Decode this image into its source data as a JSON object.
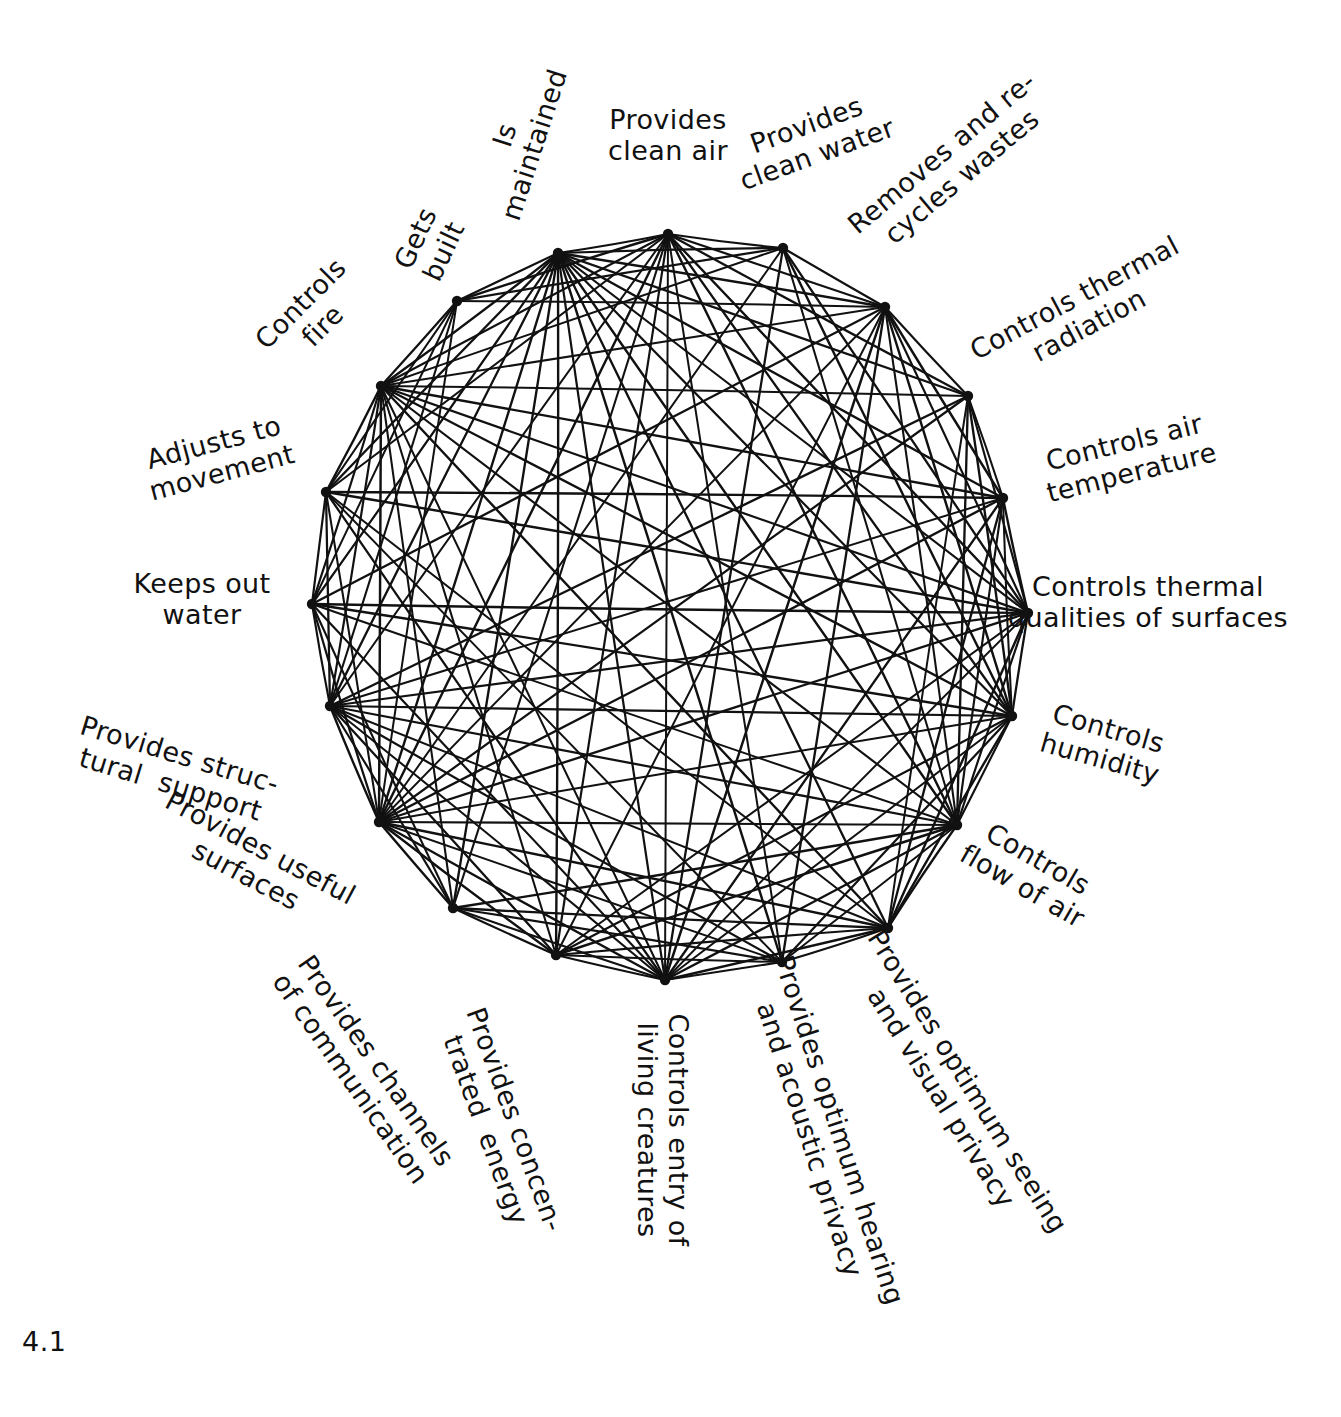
{
  "figure": {
    "number": "4.1",
    "type": "node-link circular interaction net diagram",
    "node_count": 19,
    "background_color": "#ffffff",
    "ink_color": "#111111"
  },
  "nodes": [
    {
      "id": 0,
      "label": "Provides\nclean air",
      "label_line1": "Provides",
      "label_line2": "clean air",
      "x": 668,
      "y": 234,
      "label_x": 668,
      "label_y": 136,
      "rotation": 0
    },
    {
      "id": 1,
      "label": "Provides\nclean water",
      "label_line1": "Provides",
      "label_line2": "clean water",
      "x": 783,
      "y": 248,
      "label_x": 812,
      "label_y": 140,
      "rotation": 20
    },
    {
      "id": 2,
      "label": "Removes and re-\ncycles wastes",
      "label_line1": "Removes and re-",
      "label_line2": "cycles wastes",
      "x": 885,
      "y": 307,
      "label_x": 952,
      "label_y": 165,
      "rotation": 40
    },
    {
      "id": 3,
      "label": "Controls thermal\nradiation",
      "label_line1": "Controls thermal",
      "label_line2": "radiation",
      "x": 968,
      "y": 396,
      "label_x": 1082,
      "label_y": 312,
      "rotation": 28
    },
    {
      "id": 4,
      "label": "Controls air\ntemperature",
      "label_line1": "Controls air",
      "label_line2": "temperature",
      "x": 1003,
      "y": 498,
      "label_x": 1128,
      "label_y": 458,
      "rotation": 14
    },
    {
      "id": 5,
      "label": "Controls thermal\nqualities of surfaces",
      "label_line1": "Controls thermal",
      "label_line2": "qualities of surfaces",
      "x": 1028,
      "y": 613,
      "label_x": 1148,
      "label_y": 603,
      "rotation": 0
    },
    {
      "id": 6,
      "label": "Controls\nhumidity",
      "label_line1": "Controls",
      "label_line2": "humidity",
      "x": 1012,
      "y": 716,
      "label_x": 1104,
      "label_y": 744,
      "rotation": -16
    },
    {
      "id": 7,
      "label": "Controls\nflow of air",
      "label_line1": "Controls",
      "label_line2": "flow of air",
      "x": 957,
      "y": 825,
      "label_x": 1030,
      "label_y": 873,
      "rotation": -30
    },
    {
      "id": 8,
      "label": "Provides optimum seeing\nand visual privacy",
      "label_line1": "Provides optimum seeing",
      "label_line2": "and visual privacy",
      "x": 888,
      "y": 928,
      "label_x": 954,
      "label_y": 1090,
      "rotation": -58
    },
    {
      "id": 9,
      "label": "Provides optimum hearing\nand acoustic privacy",
      "label_line1": "Provides optimum hearing",
      "label_line2": "and acoustic privacy",
      "x": 782,
      "y": 962,
      "label_x": 824,
      "label_y": 1135,
      "rotation": -72
    },
    {
      "id": 10,
      "label": "Controls entry of\nliving creatures",
      "label_line1": "Controls entry of",
      "label_line2": "living creatures",
      "x": 665,
      "y": 980,
      "label_x": 662,
      "label_y": 1130,
      "rotation": -90
    },
    {
      "id": 11,
      "label": "Provides concen-\ntrated  energy",
      "label_line1": "Provides concen-",
      "label_line2": "trated  energy",
      "x": 556,
      "y": 955,
      "label_x": 500,
      "label_y": 1125,
      "rotation": -70
    },
    {
      "id": 12,
      "label": "Provides channels\nof communication",
      "label_line1": "Provides channels",
      "label_line2": "of communication",
      "x": 453,
      "y": 908,
      "label_x": 363,
      "label_y": 1070,
      "rotation": -55
    },
    {
      "id": 13,
      "label": "Provides useful\nsurfaces",
      "label_line1": "Provides useful",
      "label_line2": "surfaces",
      "x": 379,
      "y": 822,
      "label_x": 253,
      "label_y": 862,
      "rotation": -28
    },
    {
      "id": 14,
      "label": "Provides struc-\ntural  support",
      "label_line1": "Provides struc-",
      "label_line2": "tural  support",
      "x": 330,
      "y": 706,
      "label_x": 175,
      "label_y": 770,
      "rotation": -17
    },
    {
      "id": 15,
      "label": "Keeps out\nwater",
      "label_line1": "Keeps out",
      "label_line2": "water",
      "x": 312,
      "y": 604,
      "label_x": 202,
      "label_y": 600,
      "rotation": 0
    },
    {
      "id": 16,
      "label": "Adjusts to\nmovement",
      "label_line1": "Adjusts to",
      "label_line2": "movement",
      "x": 326,
      "y": 492,
      "label_x": 218,
      "label_y": 458,
      "rotation": 15
    },
    {
      "id": 17,
      "label": "Controls\nfire",
      "label_line1": "Controls",
      "label_line2": "fire",
      "x": 381,
      "y": 386,
      "label_x": 312,
      "label_y": 315,
      "rotation": 45
    },
    {
      "id": 18,
      "label": "Gets\nbuilt",
      "label_line1": "Gets",
      "label_line2": "built",
      "x": 457,
      "y": 301,
      "label_x": 430,
      "label_y": 245,
      "rotation": 65
    },
    {
      "id": 19,
      "label": "Is\nmaintained",
      "label_line1": "Is",
      "label_line2": "maintained",
      "x": 558,
      "y": 253,
      "label_x": 520,
      "label_y": 140,
      "rotation": 72
    }
  ],
  "edges": [
    [
      0,
      1
    ],
    [
      0,
      2
    ],
    [
      0,
      3
    ],
    [
      0,
      5
    ],
    [
      0,
      6
    ],
    [
      0,
      7
    ],
    [
      0,
      9
    ],
    [
      0,
      10
    ],
    [
      0,
      11
    ],
    [
      0,
      12
    ],
    [
      0,
      13
    ],
    [
      0,
      14
    ],
    [
      0,
      16
    ],
    [
      0,
      17
    ],
    [
      0,
      18
    ],
    [
      0,
      19
    ],
    [
      1,
      2
    ],
    [
      1,
      5
    ],
    [
      1,
      6
    ],
    [
      1,
      7
    ],
    [
      1,
      10
    ],
    [
      1,
      13
    ],
    [
      1,
      17
    ],
    [
      1,
      18
    ],
    [
      1,
      19
    ],
    [
      2,
      3
    ],
    [
      2,
      4
    ],
    [
      2,
      5
    ],
    [
      2,
      6
    ],
    [
      2,
      7
    ],
    [
      2,
      9
    ],
    [
      2,
      10
    ],
    [
      2,
      11
    ],
    [
      2,
      13
    ],
    [
      2,
      15
    ],
    [
      2,
      17
    ],
    [
      2,
      18
    ],
    [
      2,
      19
    ],
    [
      3,
      4
    ],
    [
      3,
      5
    ],
    [
      3,
      6
    ],
    [
      3,
      7
    ],
    [
      3,
      8
    ],
    [
      3,
      13
    ],
    [
      3,
      14
    ],
    [
      3,
      17
    ],
    [
      3,
      19
    ],
    [
      4,
      5
    ],
    [
      4,
      6
    ],
    [
      4,
      7
    ],
    [
      4,
      8
    ],
    [
      4,
      10
    ],
    [
      4,
      13
    ],
    [
      4,
      14
    ],
    [
      4,
      16
    ],
    [
      4,
      17
    ],
    [
      4,
      19
    ],
    [
      5,
      6
    ],
    [
      5,
      7
    ],
    [
      5,
      8
    ],
    [
      5,
      10
    ],
    [
      5,
      11
    ],
    [
      5,
      13
    ],
    [
      5,
      14
    ],
    [
      5,
      15
    ],
    [
      5,
      16
    ],
    [
      5,
      17
    ],
    [
      5,
      19
    ],
    [
      6,
      7
    ],
    [
      6,
      8
    ],
    [
      6,
      9
    ],
    [
      6,
      10
    ],
    [
      6,
      11
    ],
    [
      6,
      13
    ],
    [
      6,
      14
    ],
    [
      6,
      15
    ],
    [
      6,
      17
    ],
    [
      6,
      19
    ],
    [
      7,
      8
    ],
    [
      7,
      9
    ],
    [
      7,
      10
    ],
    [
      7,
      11
    ],
    [
      7,
      12
    ],
    [
      7,
      13
    ],
    [
      7,
      14
    ],
    [
      7,
      15
    ],
    [
      7,
      17
    ],
    [
      7,
      19
    ],
    [
      8,
      9
    ],
    [
      8,
      10
    ],
    [
      8,
      11
    ],
    [
      8,
      12
    ],
    [
      8,
      13
    ],
    [
      8,
      14
    ],
    [
      8,
      16
    ],
    [
      8,
      17
    ],
    [
      8,
      19
    ],
    [
      9,
      10
    ],
    [
      9,
      11
    ],
    [
      9,
      12
    ],
    [
      9,
      13
    ],
    [
      9,
      14
    ],
    [
      9,
      16
    ],
    [
      9,
      19
    ],
    [
      10,
      11
    ],
    [
      10,
      12
    ],
    [
      10,
      13
    ],
    [
      10,
      14
    ],
    [
      10,
      15
    ],
    [
      10,
      16
    ],
    [
      10,
      17
    ],
    [
      10,
      19
    ],
    [
      11,
      12
    ],
    [
      11,
      13
    ],
    [
      11,
      14
    ],
    [
      11,
      17
    ],
    [
      11,
      19
    ],
    [
      12,
      13
    ],
    [
      12,
      14
    ],
    [
      12,
      15
    ],
    [
      12,
      17
    ],
    [
      12,
      19
    ],
    [
      13,
      14
    ],
    [
      13,
      15
    ],
    [
      13,
      16
    ],
    [
      13,
      17
    ],
    [
      13,
      18
    ],
    [
      13,
      19
    ],
    [
      14,
      15
    ],
    [
      14,
      16
    ],
    [
      14,
      17
    ],
    [
      14,
      18
    ],
    [
      14,
      19
    ],
    [
      15,
      16
    ],
    [
      15,
      17
    ],
    [
      15,
      18
    ],
    [
      15,
      19
    ],
    [
      16,
      17
    ],
    [
      16,
      18
    ],
    [
      16,
      19
    ],
    [
      17,
      18
    ],
    [
      17,
      19
    ],
    [
      18,
      19
    ]
  ]
}
